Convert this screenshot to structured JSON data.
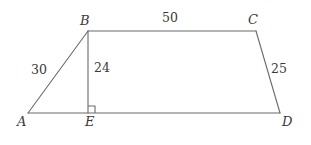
{
  "figure": {
    "type": "geometry-diagram",
    "shape": "trapezoid-with-altitude",
    "background_color": "#ffffff",
    "stroke_color": "#6a6a6a",
    "text_color": "#3a3a3a",
    "stroke_width": 1.1,
    "vertices": [
      {
        "id": "A",
        "label": "A",
        "x": 28,
        "y": 113
      },
      {
        "id": "B",
        "label": "B",
        "x": 88,
        "y": 31
      },
      {
        "id": "C",
        "label": "C",
        "x": 256,
        "y": 31
      },
      {
        "id": "D",
        "label": "D",
        "x": 280,
        "y": 113
      },
      {
        "id": "E",
        "label": "E",
        "x": 88,
        "y": 113
      }
    ],
    "edges": [
      {
        "id": "AB",
        "from": "A",
        "to": "B",
        "length_label": "30"
      },
      {
        "id": "BC",
        "from": "B",
        "to": "C",
        "length_label": "50"
      },
      {
        "id": "CD",
        "from": "C",
        "to": "D",
        "length_label": "25"
      },
      {
        "id": "AD",
        "from": "A",
        "to": "D",
        "length_label": ""
      },
      {
        "id": "BE",
        "from": "B",
        "to": "E",
        "length_label": "24"
      }
    ],
    "right_angle": {
      "at": "E",
      "marker": "right-angle-square",
      "size": 7
    },
    "labels": {
      "A": "A",
      "B": "B",
      "C": "C",
      "D": "D",
      "E": "E",
      "AB": "30",
      "BE": "24",
      "BC": "50",
      "CD": "25"
    }
  }
}
